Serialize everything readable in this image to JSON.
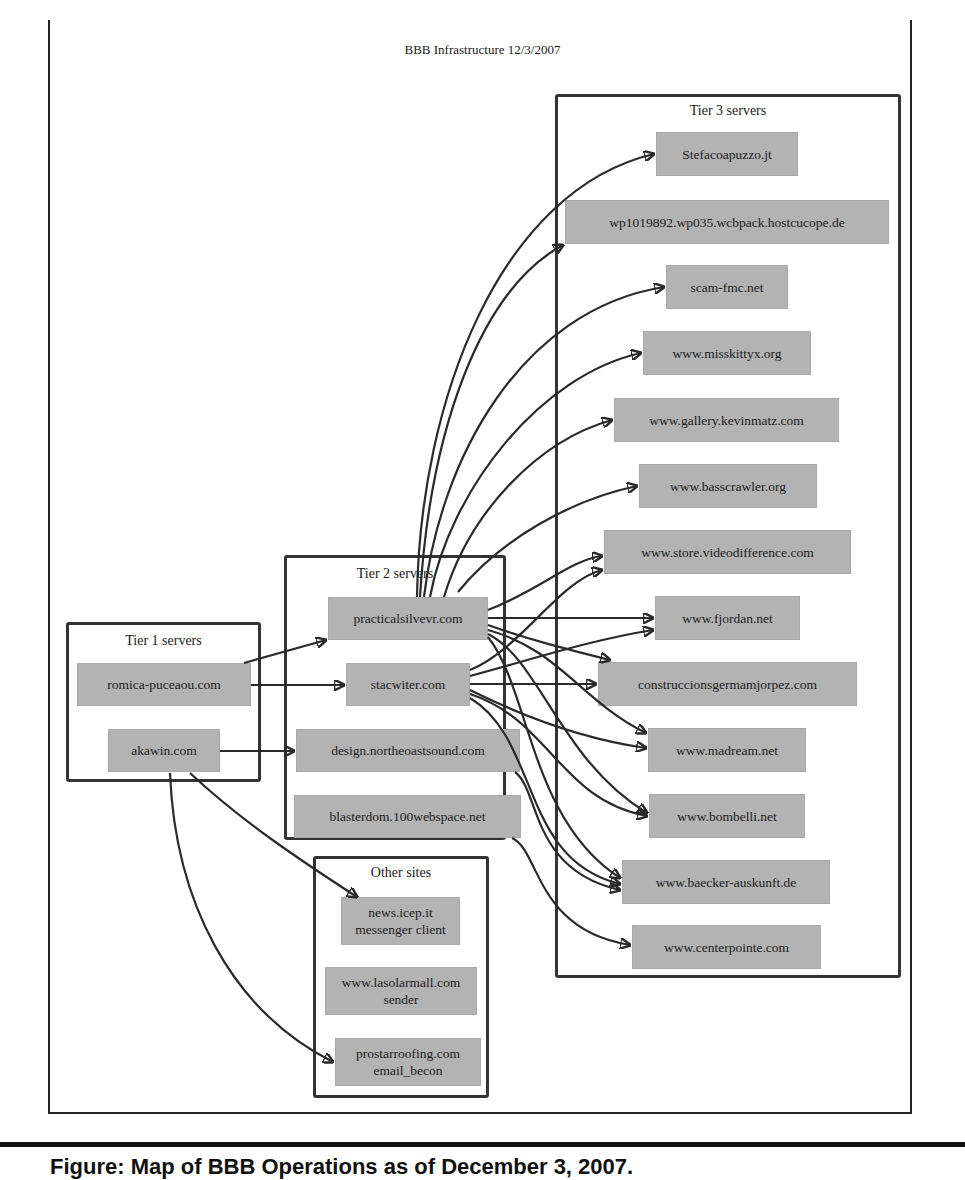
{
  "diagram": {
    "title": "BBB Infrastructure 12/3/2007",
    "clusters": {
      "tier1": {
        "label": "Tier 1 servers",
        "nodes": [
          "romica-puceaou.com",
          "akawin.com"
        ]
      },
      "tier2": {
        "label": "Tier 2 servers",
        "nodes": [
          "practicalsilvevr.com",
          "stacwiter.com",
          "design.northeoastsound.com",
          "blasterdom.100webspace.net"
        ]
      },
      "tier3": {
        "label": "Tier 3 servers",
        "nodes": [
          "Stefacoapuzzo.jt",
          "wp1019892.wp035.wcbpack.hostcucope.de",
          "scam-fmc.net",
          "www.misskittyx.org",
          "www.gallery.kevinmatz.com",
          "www.basscrawler.org",
          "www.store.videodifference.com",
          "www.fjordan.net",
          "construccionsgermamjorpez.com",
          "www.madream.net",
          "www.bombelli.net",
          "www.baecker-auskunft.de",
          "www.centerpointe.com"
        ]
      },
      "other": {
        "label": "Other sites",
        "nodes": [
          {
            "line1": "news.icep.it",
            "line2": "messenger client"
          },
          {
            "line1": "www.lasolarmall.com",
            "line2": "sender"
          },
          {
            "line1": "prostarroofing.com",
            "line2": "email_becon"
          }
        ]
      }
    },
    "edges": [
      {
        "from": "romica-puceaou.com",
        "to": "practicalsilvevr.com"
      },
      {
        "from": "romica-puceaou.com",
        "to": "stacwiter.com"
      },
      {
        "from": "akawin.com",
        "to": "design.northeoastsound.com"
      },
      {
        "from": "akawin.com",
        "to": "news.icep.it"
      },
      {
        "from": "akawin.com",
        "to": "prostarroofing.com"
      },
      {
        "from": "practicalsilvevr.com",
        "to": "Stefacoapuzzo.jt"
      },
      {
        "from": "practicalsilvevr.com",
        "to": "wp1019892.wp035.wcbpack.hostcucope.de"
      },
      {
        "from": "practicalsilvevr.com",
        "to": "scam-fmc.net"
      },
      {
        "from": "practicalsilvevr.com",
        "to": "www.misskittyx.org"
      },
      {
        "from": "practicalsilvevr.com",
        "to": "www.gallery.kevinmatz.com"
      },
      {
        "from": "practicalsilvevr.com",
        "to": "www.basscrawler.org"
      },
      {
        "from": "practicalsilvevr.com",
        "to": "www.store.videodifference.com"
      },
      {
        "from": "practicalsilvevr.com",
        "to": "www.fjordan.net"
      },
      {
        "from": "practicalsilvevr.com",
        "to": "construccionsgermamjorpez.com"
      },
      {
        "from": "practicalsilvevr.com",
        "to": "www.madream.net"
      },
      {
        "from": "practicalsilvevr.com",
        "to": "www.bombelli.net"
      },
      {
        "from": "practicalsilvevr.com",
        "to": "www.baecker-auskunft.de"
      },
      {
        "from": "stacwiter.com",
        "to": "www.store.videodifference.com"
      },
      {
        "from": "stacwiter.com",
        "to": "www.fjordan.net"
      },
      {
        "from": "stacwiter.com",
        "to": "construccionsgermamjorpez.com"
      },
      {
        "from": "stacwiter.com",
        "to": "www.madream.net"
      },
      {
        "from": "stacwiter.com",
        "to": "www.bombelli.net"
      },
      {
        "from": "stacwiter.com",
        "to": "www.baecker-auskunft.de"
      },
      {
        "from": "design.northeoastsound.com",
        "to": "www.baecker-auskunft.de"
      },
      {
        "from": "blasterdom.100webspace.net",
        "to": "www.centerpointe.com"
      }
    ],
    "colors": {
      "node_fill": "#b3b3b3",
      "cluster_border": "#333333",
      "edge": "#2a2a2a"
    }
  },
  "caption": {
    "text": "Figure: Map of BBB Operations as of December 3, 2007."
  }
}
